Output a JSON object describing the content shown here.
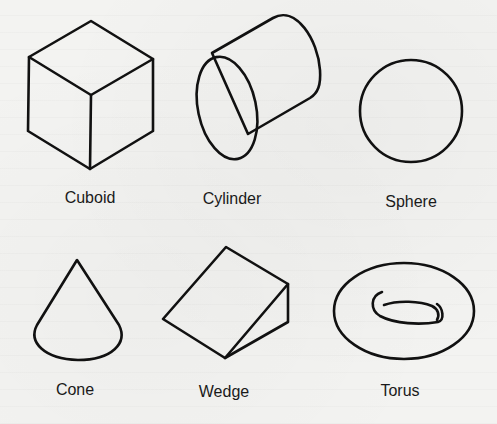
{
  "figure": {
    "shapes": [
      {
        "id": "cuboid",
        "label": "Cuboid",
        "icon": "cuboid-icon"
      },
      {
        "id": "cylinder",
        "label": "Cylinder",
        "icon": "cylinder-icon"
      },
      {
        "id": "sphere",
        "label": "Sphere",
        "icon": "sphere-icon"
      },
      {
        "id": "cone",
        "label": "Cone",
        "icon": "cone-icon"
      },
      {
        "id": "wedge",
        "label": "Wedge",
        "icon": "wedge-icon"
      },
      {
        "id": "torus",
        "label": "Torus",
        "icon": "torus-icon"
      }
    ]
  },
  "colors": {
    "stroke": "#111111",
    "paper": "#f3f3f1",
    "text": "#1a1a1a"
  }
}
